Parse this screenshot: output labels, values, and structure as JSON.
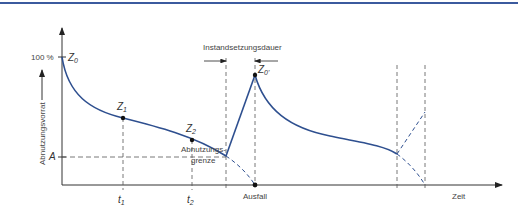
{
  "diagram": {
    "y_axis_label": "Abnutzungsvorrat",
    "x_axis_label": "Zeit",
    "y_tick_100": "100 %",
    "y_tick_A": "A",
    "points": {
      "z0": "Z",
      "z0_sub": "0",
      "z1": "Z",
      "z1_sub": "1",
      "z2": "Z",
      "z2_sub": "2",
      "z0p": "Z",
      "z0p_sub": "0'"
    },
    "x_ticks": {
      "t1": "t",
      "t1_sub": "1",
      "t2": "t",
      "t2_sub": "2"
    },
    "annotations": {
      "repair_duration": "Instandsetzungsdauer",
      "wear_limit_line1": "Abnutzungs-",
      "wear_limit_line2": "grenze",
      "failure": "Ausfall"
    },
    "colors": {
      "curve": "#2e4f8f",
      "axis": "#333333",
      "dashed": "#555555",
      "top_rule": "#3b5a9e"
    }
  }
}
